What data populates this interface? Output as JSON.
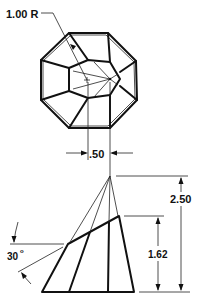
{
  "labels": {
    "radius": "1.00 R",
    "offset": ".50",
    "total_height": "2.50",
    "frustum_height": "1.62",
    "angle": "30",
    "angle_unit": "o"
  },
  "top_view": {
    "shape": "octagon with inner faceted pentagon (top view of truncated pyramid)",
    "octagon_vertices": [
      [
        69,
        33
      ],
      [
        108,
        33
      ],
      [
        136,
        61
      ],
      [
        137,
        100
      ],
      [
        110,
        128
      ],
      [
        69,
        128
      ],
      [
        41,
        100
      ],
      [
        41,
        60
      ]
    ]
  },
  "front_view": {
    "shape": "truncated oblique pyramid elevation",
    "apex": [
      110,
      176
    ],
    "top_edge": [
      [
        68,
        244
      ],
      [
        119,
        216
      ]
    ],
    "bottom_edge": [
      [
        42,
        292
      ],
      [
        134,
        292
      ]
    ]
  },
  "colors": {
    "line": "#111111",
    "background": "#ffffff"
  }
}
